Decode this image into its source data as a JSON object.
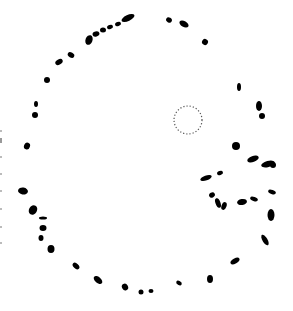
{
  "image": {
    "description": "Ring of irregular black blobs on white background with a small dotted circle inside",
    "background": "#ffffff",
    "blob_color": "#000000",
    "dotted_circle": {
      "cx": 188,
      "cy": 120,
      "r": 14,
      "color": "#555555"
    },
    "blobs": [
      {
        "cx": 128,
        "cy": 18,
        "rx": 7,
        "ry": 3,
        "rot": -25
      },
      {
        "cx": 118,
        "cy": 24,
        "rx": 3,
        "ry": 2,
        "rot": -20
      },
      {
        "cx": 110,
        "cy": 27,
        "rx": 3,
        "ry": 2,
        "rot": -20
      },
      {
        "cx": 103,
        "cy": 30,
        "rx": 3,
        "ry": 2.5,
        "rot": 0
      },
      {
        "cx": 96,
        "cy": 34,
        "rx": 3.5,
        "ry": 2.5,
        "rot": -15
      },
      {
        "cx": 89,
        "cy": 40,
        "rx": 3.5,
        "ry": 5,
        "rot": 20
      },
      {
        "cx": 71,
        "cy": 55,
        "rx": 3.5,
        "ry": 2.5,
        "rot": 30
      },
      {
        "cx": 59,
        "cy": 62,
        "rx": 4,
        "ry": 2.5,
        "rot": -30
      },
      {
        "cx": 47,
        "cy": 80,
        "rx": 3,
        "ry": 3,
        "rot": 0
      },
      {
        "cx": 36,
        "cy": 104,
        "rx": 2,
        "ry": 3,
        "rot": 0
      },
      {
        "cx": 35,
        "cy": 115,
        "rx": 3,
        "ry": 3,
        "rot": 0
      },
      {
        "cx": 27,
        "cy": 146,
        "rx": 3,
        "ry": 3.5,
        "rot": 20
      },
      {
        "cx": 23,
        "cy": 191,
        "rx": 5,
        "ry": 3.5,
        "rot": 10
      },
      {
        "cx": 33,
        "cy": 210,
        "rx": 4,
        "ry": 5,
        "rot": 30
      },
      {
        "cx": 43,
        "cy": 218,
        "rx": 4,
        "ry": 1.5,
        "rot": 0
      },
      {
        "cx": 43,
        "cy": 228,
        "rx": 3.5,
        "ry": 3,
        "rot": 0
      },
      {
        "cx": 41,
        "cy": 238,
        "rx": 2.5,
        "ry": 3,
        "rot": 0
      },
      {
        "cx": 51,
        "cy": 249,
        "rx": 3.5,
        "ry": 4,
        "rot": 0
      },
      {
        "cx": 76,
        "cy": 266,
        "rx": 2.5,
        "ry": 4,
        "rot": -45
      },
      {
        "cx": 98,
        "cy": 280,
        "rx": 3,
        "ry": 5,
        "rot": -50
      },
      {
        "cx": 125,
        "cy": 287,
        "rx": 3,
        "ry": 3.5,
        "rot": -30
      },
      {
        "cx": 141,
        "cy": 292,
        "rx": 2.5,
        "ry": 2.5,
        "rot": 0
      },
      {
        "cx": 151,
        "cy": 291,
        "rx": 2.5,
        "ry": 2,
        "rot": 0
      },
      {
        "cx": 179,
        "cy": 283,
        "rx": 3,
        "ry": 2,
        "rot": 30
      },
      {
        "cx": 210,
        "cy": 279,
        "rx": 3,
        "ry": 4,
        "rot": 0
      },
      {
        "cx": 235,
        "cy": 261,
        "rx": 5,
        "ry": 2.5,
        "rot": -30
      },
      {
        "cx": 265,
        "cy": 240,
        "rx": 2.5,
        "ry": 6,
        "rot": -30
      },
      {
        "cx": 236,
        "cy": 146,
        "rx": 4,
        "ry": 4,
        "rot": 0
      },
      {
        "cx": 253,
        "cy": 159,
        "rx": 6,
        "ry": 3,
        "rot": -20
      },
      {
        "cx": 268,
        "cy": 164,
        "rx": 7,
        "ry": 3,
        "rot": -15
      },
      {
        "cx": 273,
        "cy": 165,
        "rx": 3,
        "ry": 3,
        "rot": 0
      },
      {
        "cx": 206,
        "cy": 178,
        "rx": 6,
        "ry": 2.5,
        "rot": -20
      },
      {
        "cx": 220,
        "cy": 173,
        "rx": 3,
        "ry": 2,
        "rot": -20
      },
      {
        "cx": 212,
        "cy": 195,
        "rx": 3,
        "ry": 2.5,
        "rot": -30
      },
      {
        "cx": 218,
        "cy": 203,
        "rx": 2.5,
        "ry": 5,
        "rot": -20
      },
      {
        "cx": 224,
        "cy": 206,
        "rx": 2.5,
        "ry": 4,
        "rot": 20
      },
      {
        "cx": 242,
        "cy": 202,
        "rx": 5,
        "ry": 3,
        "rot": -10
      },
      {
        "cx": 254,
        "cy": 199,
        "rx": 4,
        "ry": 2,
        "rot": 20
      },
      {
        "cx": 272,
        "cy": 192,
        "rx": 4,
        "ry": 2,
        "rot": 20
      },
      {
        "cx": 271,
        "cy": 215,
        "rx": 3.5,
        "ry": 6,
        "rot": 0
      },
      {
        "cx": 262,
        "cy": 116,
        "rx": 3,
        "ry": 3,
        "rot": 0
      },
      {
        "cx": 259,
        "cy": 106,
        "rx": 3,
        "ry": 5,
        "rot": 0
      },
      {
        "cx": 239,
        "cy": 87,
        "rx": 2,
        "ry": 4,
        "rot": 0
      },
      {
        "cx": 205,
        "cy": 42,
        "rx": 3,
        "ry": 3,
        "rot": 30
      },
      {
        "cx": 184,
        "cy": 24,
        "rx": 5,
        "ry": 3,
        "rot": 30
      },
      {
        "cx": 169,
        "cy": 20,
        "rx": 3,
        "ry": 2.5,
        "rot": 30
      }
    ]
  }
}
